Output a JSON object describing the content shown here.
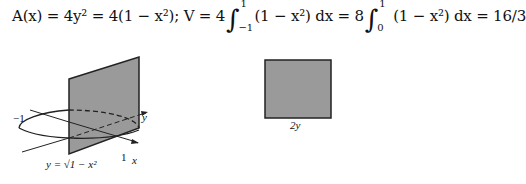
{
  "equation": {
    "part1": "A(x) = 4y² = 4(1 − x²); V = 4",
    "int1_upper": "1",
    "int1_lower": "−1",
    "part2": "(1 − x²) dx = 8",
    "int2_upper": "1",
    "int2_lower": "0",
    "part3": "(1 − x²) dx = 16/3"
  },
  "left_figure": {
    "label_minus_one": "−1",
    "label_one": "1",
    "label_x": "x",
    "label_y": "y",
    "label_curve": "y = √1 − x²"
  },
  "right_figure": {
    "label_side": "2y"
  },
  "colors": {
    "shade": "#9a9a9a",
    "stroke": "#222222"
  }
}
